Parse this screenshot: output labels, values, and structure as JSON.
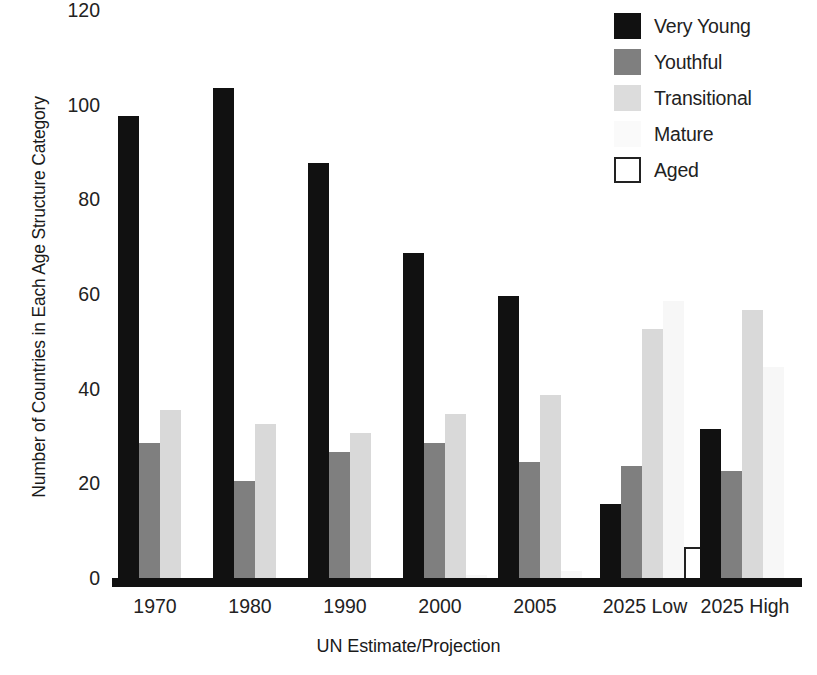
{
  "chart_data": {
    "type": "bar",
    "title": "",
    "xlabel": "UN Estimate/Projection",
    "ylabel": "Number of Countries in Each Age Structure Category",
    "categories": [
      "1970",
      "1980",
      "1990",
      "2000",
      "2005",
      "2025 Low",
      "2025 High"
    ],
    "series": [
      {
        "name": "Very Young",
        "color": "#111111",
        "values": [
          98,
          104,
          88,
          69,
          60,
          16,
          32
        ]
      },
      {
        "name": "Youthful",
        "color": "#7f7f7f",
        "values": [
          29,
          21,
          27,
          29,
          25,
          24,
          23
        ]
      },
      {
        "name": "Transitional",
        "color": "#d9d9d9",
        "values": [
          36,
          33,
          31,
          35,
          39,
          53,
          57
        ]
      },
      {
        "name": "Mature",
        "color": "#f7f7f7",
        "values": [
          0,
          0,
          0,
          1,
          2,
          59,
          45
        ]
      },
      {
        "name": "Aged",
        "color": "#ffffff",
        "values": [
          0,
          0,
          0,
          0,
          0,
          7,
          0
        ]
      }
    ],
    "yticks": [
      0,
      20,
      40,
      60,
      80,
      100,
      120
    ],
    "ylim": [
      0,
      120
    ],
    "grid": false,
    "legend_position": "top-right"
  },
  "legend": {
    "items": [
      {
        "label": "Very Young",
        "swatch": "vy"
      },
      {
        "label": "Youthful",
        "swatch": "yo"
      },
      {
        "label": "Transitional",
        "swatch": "tr"
      },
      {
        "label": "Mature",
        "swatch": "ma"
      },
      {
        "label": "Aged",
        "swatch": "ag"
      }
    ]
  }
}
